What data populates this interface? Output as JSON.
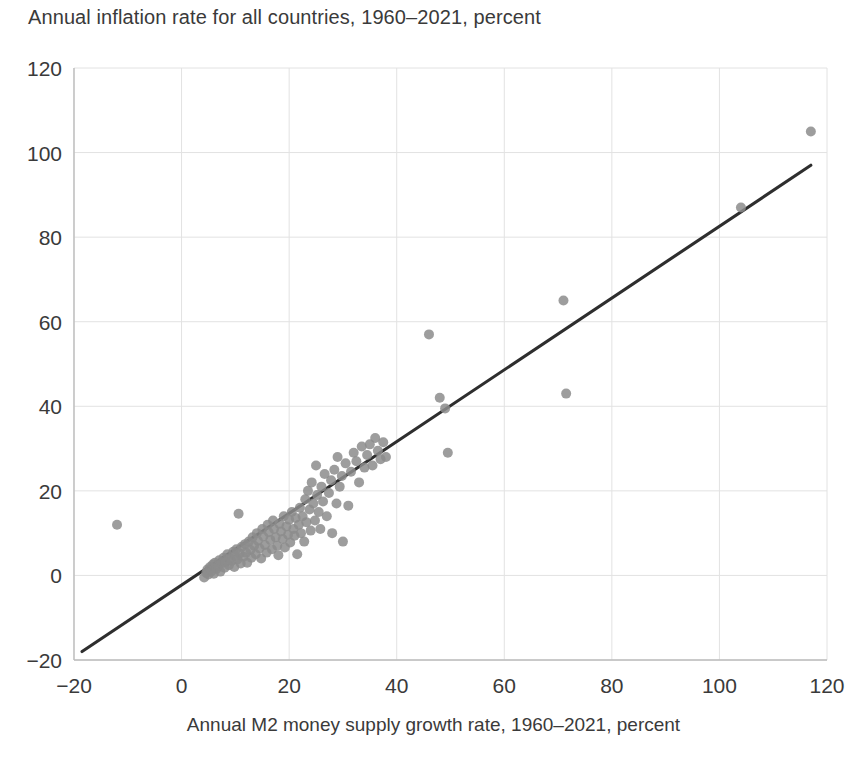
{
  "chart_data": {
    "type": "scatter",
    "title": "Annual inflation rate for all countries, 1960–2021, percent",
    "xlabel": "Annual M2 money supply growth rate, 1960–2021, percent",
    "ylabel": "",
    "xlim": [
      -20,
      120
    ],
    "ylim": [
      -20,
      120
    ],
    "xticks": [
      -20,
      0,
      20,
      40,
      60,
      80,
      100,
      120
    ],
    "yticks": [
      -20,
      0,
      20,
      40,
      60,
      80,
      100,
      120
    ],
    "xtick_labels": [
      "−20",
      "0",
      "20",
      "40",
      "60",
      "80",
      "100",
      "120"
    ],
    "ytick_labels": [
      "−20",
      "0",
      "20",
      "40",
      "60",
      "80",
      "100",
      "120"
    ],
    "grid": true,
    "legend": null,
    "point_color": "#8c8c8c",
    "point_radius": 5,
    "line_color": "#2e2e2e",
    "grid_color": "#e2e2e2",
    "axis_color": "#bdbdbd",
    "trendline": {
      "type": "linear-fit",
      "x_start": -18.5,
      "y_start": -18.0,
      "x_end": 117.0,
      "y_end": 97.0,
      "slope": 0.848,
      "intercept": -2.3
    },
    "points": [
      [
        -12.0,
        12.0
      ],
      [
        4.2,
        -0.5
      ],
      [
        4.6,
        0.6
      ],
      [
        4.8,
        1.4
      ],
      [
        5.0,
        0.2
      ],
      [
        5.3,
        2.0
      ],
      [
        5.6,
        1.0
      ],
      [
        5.8,
        2.6
      ],
      [
        6.0,
        0.4
      ],
      [
        6.2,
        3.0
      ],
      [
        6.5,
        1.6
      ],
      [
        6.8,
        2.2
      ],
      [
        7.0,
        3.6
      ],
      [
        7.2,
        0.9
      ],
      [
        7.5,
        2.9
      ],
      [
        7.8,
        4.2
      ],
      [
        8.0,
        1.8
      ],
      [
        8.2,
        3.2
      ],
      [
        8.5,
        5.0
      ],
      [
        8.8,
        2.4
      ],
      [
        9.0,
        4.0
      ],
      [
        9.3,
        3.4
      ],
      [
        9.6,
        5.6
      ],
      [
        9.8,
        2.0
      ],
      [
        10.0,
        4.6
      ],
      [
        10.2,
        6.2
      ],
      [
        10.4,
        3.8
      ],
      [
        10.6,
        14.6
      ],
      [
        10.8,
        5.2
      ],
      [
        11.0,
        2.8
      ],
      [
        11.2,
        6.8
      ],
      [
        11.5,
        4.4
      ],
      [
        11.8,
        7.4
      ],
      [
        12.0,
        5.4
      ],
      [
        12.2,
        3.0
      ],
      [
        12.5,
        8.0
      ],
      [
        12.8,
        6.0
      ],
      [
        13.0,
        4.2
      ],
      [
        13.2,
        9.0
      ],
      [
        13.5,
        7.0
      ],
      [
        13.8,
        5.0
      ],
      [
        14.0,
        10.0
      ],
      [
        14.2,
        8.2
      ],
      [
        14.5,
        6.4
      ],
      [
        14.8,
        4.0
      ],
      [
        15.0,
        11.0
      ],
      [
        15.2,
        9.2
      ],
      [
        15.5,
        7.2
      ],
      [
        15.8,
        5.4
      ],
      [
        16.0,
        12.0
      ],
      [
        16.2,
        10.2
      ],
      [
        16.5,
        8.4
      ],
      [
        16.8,
        6.2
      ],
      [
        17.0,
        13.0
      ],
      [
        17.2,
        11.0
      ],
      [
        17.5,
        9.0
      ],
      [
        17.8,
        7.0
      ],
      [
        18.0,
        4.8
      ],
      [
        18.2,
        12.2
      ],
      [
        18.5,
        10.4
      ],
      [
        18.8,
        8.6
      ],
      [
        19.0,
        14.0
      ],
      [
        19.2,
        6.6
      ],
      [
        19.5,
        11.6
      ],
      [
        19.8,
        9.6
      ],
      [
        20.0,
        13.2
      ],
      [
        20.2,
        7.8
      ],
      [
        20.5,
        15.0
      ],
      [
        20.8,
        11.0
      ],
      [
        21.0,
        9.4
      ],
      [
        21.2,
        13.6
      ],
      [
        21.5,
        5.0
      ],
      [
        21.8,
        12.0
      ],
      [
        22.0,
        16.0
      ],
      [
        22.2,
        10.0
      ],
      [
        22.5,
        14.0
      ],
      [
        22.8,
        8.0
      ],
      [
        23.0,
        18.0
      ],
      [
        23.2,
        12.6
      ],
      [
        23.5,
        20.0
      ],
      [
        23.8,
        15.6
      ],
      [
        24.0,
        10.6
      ],
      [
        24.2,
        22.0
      ],
      [
        24.5,
        17.0
      ],
      [
        24.8,
        13.0
      ],
      [
        25.0,
        26.0
      ],
      [
        25.2,
        19.0
      ],
      [
        25.5,
        15.0
      ],
      [
        25.8,
        11.0
      ],
      [
        26.0,
        21.0
      ],
      [
        26.3,
        17.5
      ],
      [
        26.6,
        24.0
      ],
      [
        27.0,
        14.0
      ],
      [
        27.4,
        19.5
      ],
      [
        27.8,
        22.5
      ],
      [
        28.0,
        10.0
      ],
      [
        28.4,
        25.0
      ],
      [
        28.8,
        17.0
      ],
      [
        29.0,
        28.0
      ],
      [
        29.4,
        21.0
      ],
      [
        29.8,
        23.5
      ],
      [
        30.0,
        8.0
      ],
      [
        30.5,
        26.5
      ],
      [
        31.0,
        16.5
      ],
      [
        31.5,
        24.5
      ],
      [
        32.0,
        29.0
      ],
      [
        32.5,
        27.0
      ],
      [
        33.0,
        22.0
      ],
      [
        33.5,
        30.5
      ],
      [
        34.0,
        25.5
      ],
      [
        34.5,
        28.5
      ],
      [
        35.0,
        31.0
      ],
      [
        35.5,
        26.0
      ],
      [
        36.0,
        32.5
      ],
      [
        36.5,
        29.5
      ],
      [
        37.0,
        27.5
      ],
      [
        37.5,
        31.5
      ],
      [
        38.0,
        28.0
      ],
      [
        46.0,
        57.0
      ],
      [
        48.0,
        42.0
      ],
      [
        49.0,
        39.5
      ],
      [
        49.5,
        29.0
      ],
      [
        71.0,
        65.0
      ],
      [
        71.5,
        43.0
      ],
      [
        104.0,
        87.0
      ],
      [
        117.0,
        105.0
      ]
    ]
  }
}
